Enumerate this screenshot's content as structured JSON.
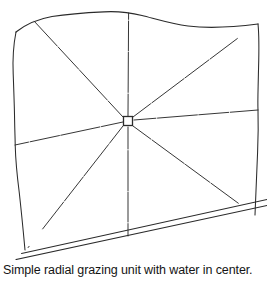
{
  "figure": {
    "kind": "line-drawing",
    "caption": "Simple radial grazing unit with water in center.",
    "background_color": "#ffffff",
    "line_color": "#2b2b2b",
    "line_width": 1.0,
    "center_label": "water point",
    "radial_spoke_count": 8,
    "paddock_count": 8
  },
  "geometry": {
    "hub": {
      "x": 128,
      "y": 121,
      "size": 9,
      "shape": "square"
    },
    "boundary": {
      "top_edge": "M 16,32 C 40,17 72,14 104,12 C 124,10 140,13 160,19 C 188,27 224,27 258,24",
      "left_edge": "M 16,32 C 12,70 14,108 15,145 C 17,185 20,218 25,250",
      "right_edge": "M 258,24 C 259,62 257,100 258,135 C 258,172 256,196 255,215",
      "bottom_road_outer": "M 18,259 L 266,205",
      "bottom_road_inner": "M 22,253 L 266,199"
    },
    "spokes": [
      {
        "name": "spoke-up",
        "to_x": 128,
        "to_y": 13
      },
      {
        "name": "spoke-upper-right",
        "to_x": 254,
        "to_y": 26
      },
      {
        "name": "spoke-right",
        "to_x": 258,
        "to_y": 110
      },
      {
        "name": "spoke-lower-right",
        "to_x": 253,
        "to_y": 214
      },
      {
        "name": "spoke-down",
        "to_x": 128,
        "to_y": 236
      },
      {
        "name": "spoke-lower-left",
        "to_x": 27,
        "to_y": 249
      },
      {
        "name": "spoke-left",
        "to_x": 15,
        "to_y": 145
      },
      {
        "name": "spoke-upper-left",
        "to_x": 34,
        "to_y": 21
      }
    ]
  }
}
